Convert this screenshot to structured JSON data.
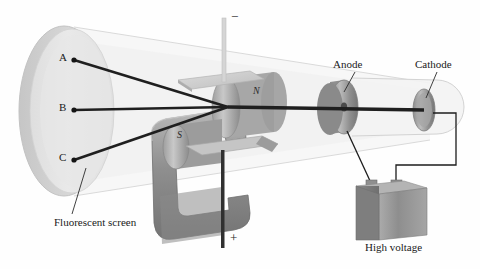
{
  "figure": {
    "background_color": "#ffffff",
    "ink_color": "#1a1a1a"
  },
  "labels": {
    "spot_a": "A",
    "spot_b": "B",
    "spot_c": "C",
    "fluorescent_screen": "Fluorescent screen",
    "anode": "Anode",
    "cathode": "Cathode",
    "high_voltage": "High voltage",
    "pole_north": "N",
    "pole_south": "S",
    "terminal_negative": "−",
    "terminal_positive": "+"
  },
  "parts": [
    {
      "name": "fluorescent-screen",
      "label": "Fluorescent screen",
      "shape": "ellipse",
      "color": "#e6e6e6"
    },
    {
      "name": "glass-tube",
      "label": "",
      "shape": "cone",
      "color": "#f4f4f4"
    },
    {
      "name": "deflection-plate-top",
      "label": "",
      "shape": "plate",
      "color": "#d8d8d8"
    },
    {
      "name": "deflection-plate-bottom",
      "label": "",
      "shape": "plate",
      "color": "#c9c9c9"
    },
    {
      "name": "horseshoe-magnet",
      "label": "",
      "shape": "u-magnet",
      "color": "#9a9a9a"
    },
    {
      "name": "magnet-pole-north",
      "label": "N",
      "shape": "cylinder",
      "color": "#b5b5b5"
    },
    {
      "name": "magnet-pole-south",
      "label": "S",
      "shape": "cylinder",
      "color": "#a8a8a8"
    },
    {
      "name": "anode-disc",
      "label": "Anode",
      "shape": "disc",
      "color": "#a3a3a3"
    },
    {
      "name": "cathode-disc",
      "label": "Cathode",
      "shape": "disc",
      "color": "#a9a9a9"
    },
    {
      "name": "high-voltage-source",
      "label": "High voltage",
      "shape": "box",
      "color": "#9d9d9d"
    },
    {
      "name": "electron-beam",
      "label": "",
      "shape": "rays",
      "color": "#1f1f1f"
    }
  ],
  "beam": {
    "origin": {
      "x": 228,
      "y": 107
    },
    "rays": [
      {
        "target": "A",
        "x": 74,
        "y": 60
      },
      {
        "target": "B",
        "x": 74,
        "y": 110
      },
      {
        "target": "C",
        "x": 74,
        "y": 160
      }
    ]
  },
  "colors": {
    "screen_face": "#e3e3e3",
    "screen_rim": "#cfcfcf",
    "tube_glass": "#f2f2f2",
    "metal_mid": "#9b9b9b",
    "metal_dark": "#767676",
    "metal_light": "#c4c4c4",
    "wire": "#1c1c1c"
  }
}
